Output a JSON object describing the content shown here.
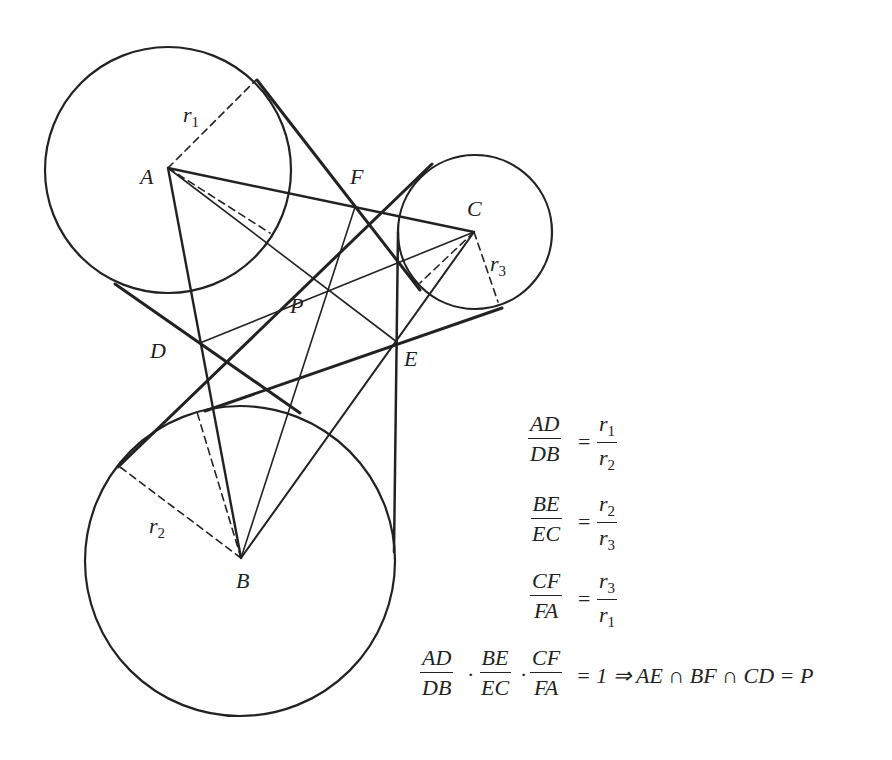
{
  "points": {
    "A": {
      "label": "A",
      "x": 168,
      "y": 168
    },
    "B": {
      "label": "B",
      "x": 241,
      "y": 558
    },
    "C": {
      "label": "C",
      "x": 474,
      "y": 232
    },
    "D": {
      "label": "D",
      "x": 200,
      "y": 343
    },
    "E": {
      "label": "E",
      "x": 397,
      "y": 342
    },
    "F": {
      "label": "F",
      "x": 355,
      "y": 207
    },
    "P": {
      "label": "P",
      "x": 329,
      "y": 291
    }
  },
  "circles": [
    {
      "center": "A",
      "cx": 168,
      "cy": 170,
      "r": 123,
      "radius_label": "r1"
    },
    {
      "center": "B",
      "cx": 240,
      "cy": 561,
      "r": 155,
      "radius_label": "r2"
    },
    {
      "center": "C",
      "cx": 475,
      "cy": 232,
      "r": 77,
      "radius_label": "r3"
    }
  ],
  "radius_labels": {
    "r1": {
      "base": "r",
      "sub": "1"
    },
    "r2": {
      "base": "r",
      "sub": "2"
    },
    "r3": {
      "base": "r",
      "sub": "3"
    }
  },
  "formulas": {
    "f1": {
      "num": "AD",
      "den": "DB",
      "eq": "=",
      "rnum": "r1",
      "rden": "r2"
    },
    "f2": {
      "num": "BE",
      "den": "EC",
      "eq": "=",
      "rnum": "r2",
      "rden": "r3"
    },
    "f3": {
      "num": "CF",
      "den": "FA",
      "eq": "=",
      "rnum": "r3",
      "rden": "r1"
    },
    "f4": {
      "fracs": [
        {
          "num": "AD",
          "den": "DB"
        },
        {
          "num": "BE",
          "den": "EC"
        },
        {
          "num": "CF",
          "den": "FA"
        }
      ],
      "dot": "·",
      "rhs": "= 1 ⇒ AE ∩ BF ∩ CD = P"
    }
  },
  "colors": {
    "ink": "#222222",
    "background": "#ffffff"
  }
}
